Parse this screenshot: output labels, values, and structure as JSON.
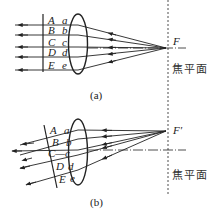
{
  "figure_a": {
    "caption": "(a)",
    "upper_labels": [
      "A",
      "B",
      "C",
      "D",
      "E"
    ],
    "lower_labels": [
      "a",
      "b",
      "c",
      "d",
      "e"
    ],
    "focus_label": "F",
    "focal_plane_label": "焦平面"
  },
  "figure_b": {
    "caption": "(b)",
    "upper_labels": [
      "A",
      "B",
      "C",
      "D",
      "E"
    ],
    "lower_labels": [
      "a",
      "b",
      "c",
      "d",
      "e"
    ],
    "c_connector": "C—c",
    "focus_label": "F′",
    "focal_plane_label": "焦平面"
  },
  "colors": {
    "line": "#222222",
    "background": "#ffffff"
  }
}
